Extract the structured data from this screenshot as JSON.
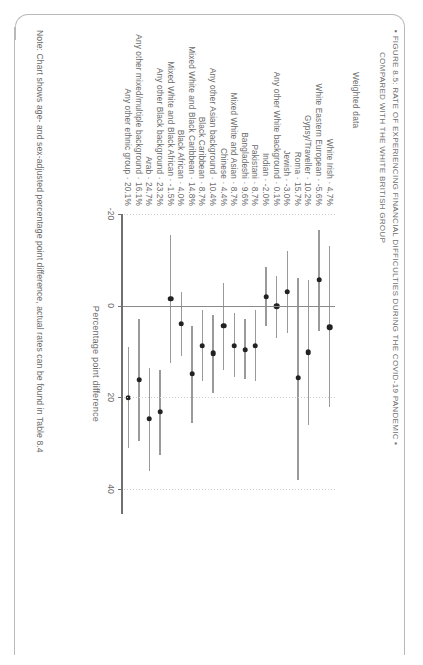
{
  "figure": {
    "title_line1": "FIGURE 8.5: RATE OF EXPERIENCING FINANCIAL DIFFICULTIES DURING THE COVID-19 PANDEMIC",
    "title_line2": "COMPARED WITH THE WHITE BRITISH GROUP",
    "bullet_left": "▪",
    "bullet_right": "▪",
    "weighted_label": "Weighted data",
    "note": "Note: Chart shows age- and sex-adjusted percentage point difference, actual rates can be found in Table 8.4"
  },
  "chart_data": {
    "type": "scatter",
    "subtitle": "Weighted data",
    "orientation": "horizontal-dot-whisker",
    "xlabel": "Percentage point difference",
    "ylabel": "",
    "xlim": [
      -20,
      45
    ],
    "xticks": [
      -20,
      0,
      20,
      40
    ],
    "xticklabels": [
      "-20",
      "0",
      "20",
      "40"
    ],
    "grid": "dotted-vertical",
    "legend": "none",
    "reference_line": 0,
    "categories": [
      "White Irish",
      "White Eastern European",
      "Gypsy/Traveller",
      "Roma",
      "Jewish",
      "Any other White background",
      "Indian",
      "Pakistani",
      "Bangladeshi",
      "Mixed White and Asian",
      "Chinese",
      "Any other Asian background",
      "Black Caribbean",
      "Mixed White and Black Caribbean",
      "Black African",
      "Mixed White and Black African",
      "Any other Black background",
      "Arab",
      "Any other mixed/multiple background",
      "Any other ethnic group"
    ],
    "value_labels": [
      "4.7%",
      "-5.6%",
      "10.2%",
      "15.7%",
      "-3.0%",
      "0.1%",
      "-2.0%",
      "8.7%",
      "9.6%",
      "8.7%",
      "4.4%",
      "10.4%",
      "8.7%",
      "14.8%",
      "4.0%",
      "-1.5%",
      "23.2%",
      "24.7%",
      "16.1%",
      "20.1%"
    ],
    "values": [
      4.7,
      -5.6,
      10.2,
      15.7,
      -3.0,
      0.1,
      -2.0,
      8.7,
      9.6,
      8.7,
      4.4,
      10.4,
      8.7,
      14.8,
      4.0,
      -1.5,
      23.2,
      24.7,
      16.1,
      20.1
    ],
    "ci_low": [
      -13.0,
      -16.5,
      -5.5,
      -6.0,
      -12.0,
      -6.5,
      -8.5,
      1.0,
      3.0,
      1.5,
      -5.0,
      2.0,
      1.0,
      4.5,
      -3.0,
      -15.5,
      14.0,
      13.5,
      3.0,
      9.0
    ],
    "ci_high": [
      22.0,
      5.5,
      26.0,
      38.0,
      6.0,
      7.0,
      4.5,
      16.5,
      16.0,
      15.5,
      14.0,
      19.0,
      16.5,
      25.5,
      11.0,
      12.5,
      32.5,
      36.0,
      29.5,
      31.0
    ]
  },
  "colors": {
    "dot": "#222222",
    "whisker": "#9a9a9a",
    "axis": "#707070",
    "text": "#6b6b6b",
    "grid": "#cfcfcf",
    "border": "#b9b9b9",
    "background": "#ffffff"
  }
}
